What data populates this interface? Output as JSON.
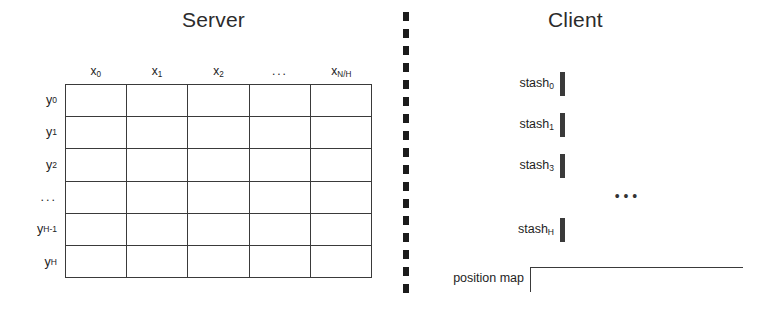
{
  "figure": {
    "type": "diagram"
  },
  "server": {
    "title": "Server",
    "grid": {
      "columns": 5,
      "rows": 6,
      "column_headers": [
        {
          "base": "x",
          "sub": "0"
        },
        {
          "base": "x",
          "sub": "1"
        },
        {
          "base": "x",
          "sub": "2"
        },
        {
          "base": "...",
          "sub": ""
        },
        {
          "base": "x",
          "sub": "N/H"
        }
      ],
      "row_headers": [
        {
          "base": "y",
          "sub": "0"
        },
        {
          "base": "y",
          "sub": "1"
        },
        {
          "base": "y",
          "sub": "2"
        },
        {
          "base": "...",
          "sub": ""
        },
        {
          "base": "y",
          "sub": "H-1"
        },
        {
          "base": "y",
          "sub": "H"
        }
      ],
      "cells": [
        "",
        "",
        "",
        "",
        "",
        "",
        "",
        "",
        "",
        "",
        "",
        "",
        "",
        "",
        "",
        "",
        "",
        "",
        "",
        "",
        "",
        "",
        "",
        "",
        "",
        "",
        "",
        "",
        "",
        ""
      ]
    }
  },
  "divider": {
    "style": "dashed-vertical",
    "color": "#1b1b1b"
  },
  "client": {
    "title": "Client",
    "stashes": [
      {
        "label": "stash",
        "sub": "0",
        "cells": 4
      },
      {
        "label": "stash",
        "sub": "1",
        "cells": 4
      },
      {
        "label": "stash",
        "sub": "3",
        "cells": 4
      },
      {
        "label": "stash",
        "sub": "H",
        "cells": 4
      }
    ],
    "ellipsis": "• • •",
    "position_map": {
      "label": "position map",
      "cells": 10
    }
  },
  "colors": {
    "line": "#3a3a3a",
    "text": "#1a1a1a",
    "background": "#ffffff"
  }
}
